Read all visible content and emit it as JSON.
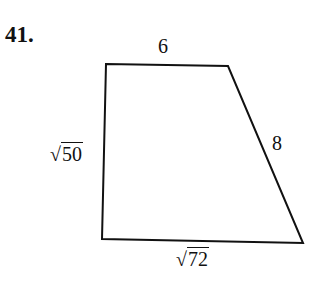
{
  "problem": {
    "number": "41."
  },
  "figure": {
    "shape": "quadrilateral",
    "vertices": [
      [
        106,
        64
      ],
      [
        228,
        66
      ],
      [
        303,
        243
      ],
      [
        102,
        239
      ]
    ],
    "labels": {
      "top": "6",
      "right": "8",
      "left_symbol": "√",
      "left_radicand": "50",
      "bottom_symbol": "√",
      "bottom_radicand": "72"
    },
    "stroke_color": "#111111"
  }
}
